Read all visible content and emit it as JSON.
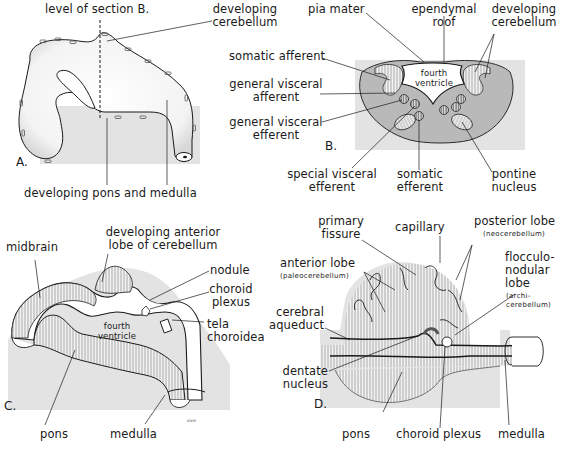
{
  "figure": {
    "panels": [
      {
        "id": "A",
        "label": "A.",
        "annotations": {
          "level_of_section": "level of section B.",
          "developing_cerebellum_1": "developing",
          "developing_cerebellum_2": "cerebellum",
          "pons_medulla": "developing pons and medulla"
        }
      },
      {
        "id": "B",
        "label": "B.",
        "annotations": {
          "pia_mater": "pia mater",
          "ependymal_roof_1": "ependymal",
          "ependymal_roof_2": "roof",
          "developing_cerebellum_1": "developing",
          "developing_cerebellum_2": "cerebellum",
          "somatic_afferent": "somatic afferent",
          "gva_1": "general visceral",
          "gva_2": "afferent",
          "gve_1": "general visceral",
          "gve_2": "efferent",
          "fourth_ventricle_1": "fourth",
          "fourth_ventricle_2": "ventricle",
          "sve_1": "special visceral",
          "sve_2": "efferent",
          "somatic_efferent_1": "somatic",
          "somatic_efferent_2": "efferent",
          "pontine_nucleus_1": "pontine",
          "pontine_nucleus_2": "nucleus"
        }
      },
      {
        "id": "C",
        "label": "C.",
        "annotations": {
          "midbrain": "midbrain",
          "anterior_lobe_1": "developing anterior",
          "anterior_lobe_2": "lobe of cerebellum",
          "nodule": "nodule",
          "choroid_plexus_1": "choroid",
          "choroid_plexus_2": "plexus",
          "fourth_ventricle_1": "fourth",
          "fourth_ventricle_2": "ventricle",
          "tela_choroidea_1": "tela",
          "tela_choroidea_2": "choroidea",
          "pons": "pons",
          "medulla": "medulla",
          "signature": "dale"
        }
      },
      {
        "id": "D",
        "label": "D.",
        "annotations": {
          "primary_fissure_1": "primary",
          "primary_fissure_2": "fissure",
          "capillary": "capillary",
          "posterior_lobe_1": "posterior lobe",
          "posterior_lobe_2": "(neocerebellum)",
          "anterior_lobe_1": "anterior lobe",
          "anterior_lobe_2": "(paleocerebellum)",
          "flocculonodular_1": "flocculo-",
          "flocculonodular_2": "nodular",
          "flocculonodular_3": "lobe",
          "flocculonodular_4": "(archi-",
          "flocculonodular_5": "cerebellum)",
          "cerebral_aqueduct_1": "cerebral",
          "cerebral_aqueduct_2": "aqueduct",
          "dentate_nucleus_1": "dentate",
          "dentate_nucleus_2": "nucleus",
          "pons": "pons",
          "choroid_plexus": "choroid plexus",
          "medulla": "medulla"
        }
      }
    ],
    "colors": {
      "background_shade": "#e3e3e3",
      "grey_matter": "#b9b9b9",
      "outline": "#1a1a1a"
    }
  }
}
